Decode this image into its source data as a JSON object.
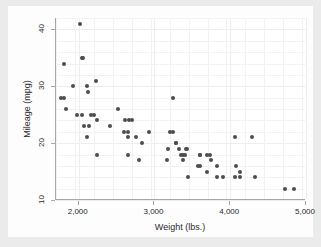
{
  "chart_data": {
    "type": "scatter",
    "title": "",
    "xlabel": "Weight (lbs.)",
    "ylabel": "Mileage (mpg)",
    "xlim": [
      1700,
      5000
    ],
    "ylim": [
      10,
      42
    ],
    "xticks": [
      2000,
      3000,
      4000,
      5000
    ],
    "xticklabels": [
      "2,000",
      "3,000",
      "4,000",
      "5,000"
    ],
    "yticks": [
      10,
      20,
      30,
      40
    ],
    "yticklabels": [
      "10",
      "20",
      "30",
      "40"
    ],
    "grid": true,
    "legend": "none",
    "marker_color": "#4d4d4d",
    "background_color": "#ebebeb",
    "plot_background_color": "#ffffff",
    "points": [
      {
        "x": 2020,
        "y": 41
      },
      {
        "x": 2050,
        "y": 35
      },
      {
        "x": 2040,
        "y": 35
      },
      {
        "x": 1800,
        "y": 34
      },
      {
        "x": 2230,
        "y": 31
      },
      {
        "x": 2110,
        "y": 30
      },
      {
        "x": 1930,
        "y": 30
      },
      {
        "x": 2120,
        "y": 29
      },
      {
        "x": 3250,
        "y": 28
      },
      {
        "x": 1760,
        "y": 28
      },
      {
        "x": 1800,
        "y": 28
      },
      {
        "x": 1830,
        "y": 26
      },
      {
        "x": 2520,
        "y": 26
      },
      {
        "x": 2160,
        "y": 25
      },
      {
        "x": 2200,
        "y": 25
      },
      {
        "x": 1980,
        "y": 25
      },
      {
        "x": 2040,
        "y": 25
      },
      {
        "x": 2610,
        "y": 24
      },
      {
        "x": 2670,
        "y": 24
      },
      {
        "x": 2700,
        "y": 24
      },
      {
        "x": 2240,
        "y": 24
      },
      {
        "x": 2070,
        "y": 23
      },
      {
        "x": 2130,
        "y": 23
      },
      {
        "x": 2410,
        "y": 23
      },
      {
        "x": 2650,
        "y": 22
      },
      {
        "x": 2600,
        "y": 22
      },
      {
        "x": 2930,
        "y": 22
      },
      {
        "x": 3210,
        "y": 22
      },
      {
        "x": 3250,
        "y": 22
      },
      {
        "x": 2110,
        "y": 21
      },
      {
        "x": 2650,
        "y": 21
      },
      {
        "x": 2750,
        "y": 21
      },
      {
        "x": 4060,
        "y": 21
      },
      {
        "x": 4290,
        "y": 21
      },
      {
        "x": 2830,
        "y": 20
      },
      {
        "x": 3280,
        "y": 20
      },
      {
        "x": 3280,
        "y": 20
      },
      {
        "x": 3180,
        "y": 19
      },
      {
        "x": 3330,
        "y": 19
      },
      {
        "x": 3420,
        "y": 19
      },
      {
        "x": 3430,
        "y": 19
      },
      {
        "x": 2240,
        "y": 18
      },
      {
        "x": 2650,
        "y": 18
      },
      {
        "x": 3350,
        "y": 18
      },
      {
        "x": 3380,
        "y": 18
      },
      {
        "x": 3400,
        "y": 18
      },
      {
        "x": 3600,
        "y": 18
      },
      {
        "x": 3690,
        "y": 18
      },
      {
        "x": 3730,
        "y": 18
      },
      {
        "x": 3600,
        "y": 18
      },
      {
        "x": 2800,
        "y": 17
      },
      {
        "x": 3170,
        "y": 17
      },
      {
        "x": 3370,
        "y": 17
      },
      {
        "x": 3740,
        "y": 17
      },
      {
        "x": 3830,
        "y": 16
      },
      {
        "x": 4080,
        "y": 16
      },
      {
        "x": 3600,
        "y": 16
      },
      {
        "x": 3570,
        "y": 16
      },
      {
        "x": 3690,
        "y": 15
      },
      {
        "x": 4130,
        "y": 15
      },
      {
        "x": 3440,
        "y": 14
      },
      {
        "x": 3830,
        "y": 14
      },
      {
        "x": 3900,
        "y": 14
      },
      {
        "x": 4060,
        "y": 14
      },
      {
        "x": 4130,
        "y": 14
      },
      {
        "x": 4330,
        "y": 14
      },
      {
        "x": 4720,
        "y": 12
      },
      {
        "x": 4840,
        "y": 12
      }
    ]
  }
}
